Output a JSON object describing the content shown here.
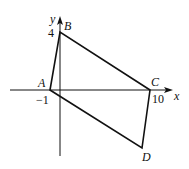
{
  "diagram": {
    "type": "coordinate-geometry",
    "axes": {
      "x_label": "x",
      "y_label": "y",
      "x_tick_labels": [
        "-1",
        "10"
      ],
      "y_tick_labels": [
        "4"
      ]
    },
    "points": [
      {
        "name": "A",
        "coords": [
          -1,
          0
        ]
      },
      {
        "name": "B",
        "coords": [
          0,
          4
        ]
      },
      {
        "name": "C",
        "coords": [
          10,
          0
        ]
      },
      {
        "name": "D",
        "coords": [
          9,
          -4
        ]
      }
    ],
    "labels": {
      "A": "A",
      "B": "B",
      "C": "C",
      "D": "D",
      "x_axis": "x",
      "y_axis": "y",
      "tick_neg1": "−1",
      "tick_10": "10",
      "tick_4": "4"
    },
    "colors": {
      "line": "#111111",
      "background": "#ffffff"
    }
  }
}
